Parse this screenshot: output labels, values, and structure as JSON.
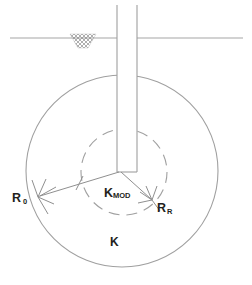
{
  "diagram": {
    "background_color": "#ffffff",
    "line_color": "#9a9a9a",
    "text_color": "#231f20",
    "width": 252,
    "height": 285
  },
  "labels": {
    "r0_main": "R",
    "r0_sub": "0",
    "rr_main": "R",
    "rr_sub": "R",
    "kmod_main": "K",
    "kmod_sub": "MOD",
    "k_main": "K"
  },
  "elements": {
    "ground_line_name": "ground-surface-line",
    "hatch_name": "ground-hatch-symbol",
    "pile_name": "pile-shaft",
    "outer_circle_name": "outer-stiffness-circle",
    "inner_circle_name": "inner-modified-stiffness-circle",
    "r0_leader_name": "r0-dimension-line",
    "rr_leader_name": "rr-dimension-line"
  },
  "geometry": {
    "ground_line_y": 38,
    "ground_line_x1": 10,
    "ground_line_x2": 243,
    "pile_left_x": 117,
    "pile_right_x": 137,
    "pile_top_y": 5,
    "pile_bottom_y": 172,
    "outer_circle_cx": 122,
    "outer_circle_cy": 171,
    "outer_circle_r": 96,
    "inner_circle_cx": 124,
    "inner_circle_cy": 172,
    "inner_circle_r": 43,
    "origin_x": 119,
    "origin_y": 172,
    "r0_arrow_x": 38,
    "r0_arrow_y": 197,
    "rr_arrow_x": 152,
    "rr_arrow_y": 200
  }
}
